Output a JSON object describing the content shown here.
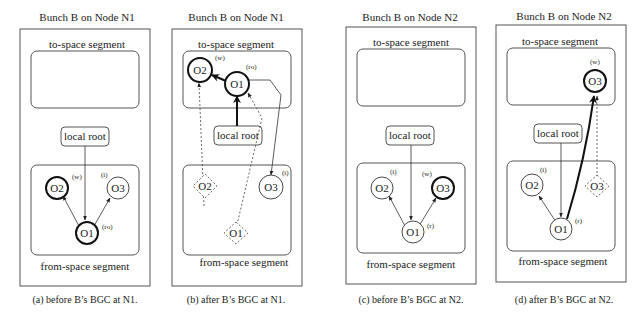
{
  "panels": [
    {
      "title": "Bunch B on Node N1",
      "to_space": "to-space segment",
      "from_space": "from-space segment",
      "local_root": "local root",
      "caption": "(a) before B’s BGC at N1.",
      "nodes": {
        "o1": {
          "label": "O1",
          "tag": "(ro)"
        },
        "o2": {
          "label": "O2",
          "tag": "(w)"
        },
        "o3": {
          "label": "O3",
          "tag": "(i)"
        }
      }
    },
    {
      "title": "Bunch B on Node N1",
      "to_space": "to-space segment",
      "from_space": "from-space segment",
      "local_root": "local root",
      "caption": "(b) after B’s BGC at N1.",
      "nodes": {
        "o1": {
          "label": "O1",
          "tag": "(ro)"
        },
        "o2": {
          "label": "O2",
          "tag": "(w)"
        },
        "o3": {
          "label": "O3",
          "tag": "(i)"
        },
        "o1_ghost": {
          "label": "O1"
        },
        "o2_ghost": {
          "label": "O2"
        }
      }
    },
    {
      "title": "Bunch B on Node N2",
      "to_space": "to-space segment",
      "from_space": "from-space segment",
      "local_root": "local root",
      "caption": "(c) before B’s BGC at N2.",
      "nodes": {
        "o1": {
          "label": "O1",
          "tag": "(r)"
        },
        "o2": {
          "label": "O2",
          "tag": "(i)"
        },
        "o3": {
          "label": "O3",
          "tag": "(w)"
        }
      }
    },
    {
      "title": "Bunch B on Node N2",
      "to_space": "to-space segment",
      "from_space": "from-space segment",
      "local_root": "local root",
      "caption": "(d) after B’s BGC at N2.",
      "nodes": {
        "o1": {
          "label": "O1",
          "tag": "(r)"
        },
        "o2": {
          "label": "O2",
          "tag": "(i)"
        },
        "o3": {
          "label": "O3",
          "tag": "(w)"
        },
        "o3_ghost": {
          "label": "O3"
        }
      }
    }
  ]
}
